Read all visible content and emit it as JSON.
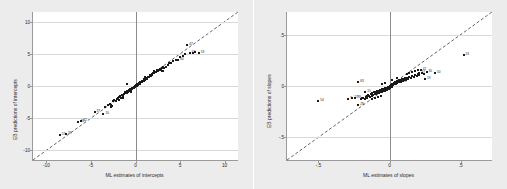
{
  "chart_data": [
    {
      "type": "scatter",
      "panel": "left",
      "title": "",
      "xlabel": "ML estimates of intercepts",
      "ylabel": "EB predictions of intercepts",
      "xlim": [
        -11.5,
        11.5
      ],
      "ylim": [
        -11.5,
        11.5
      ],
      "xticks": [
        -10,
        -5,
        0,
        5,
        10
      ],
      "xticklabels": [
        "-10",
        "-5",
        "0",
        "5",
        "10"
      ],
      "yticks": [
        -10,
        -5,
        0,
        5,
        10
      ],
      "yticklabels": [
        "-10",
        "-5",
        "0",
        "5",
        "10"
      ],
      "grid": "horizontal",
      "reference_line": {
        "type": "identity",
        "style": "dashed",
        "label": "y = x"
      },
      "points": [
        {
          "x": -8.5,
          "y": -7.6,
          "label": "57"
        },
        {
          "x": -7.8,
          "y": -7.5,
          "label": "39"
        },
        {
          "x": -6.4,
          "y": -5.6,
          "label": "40"
        },
        {
          "x": -6.1,
          "y": -5.5,
          "label": "62"
        },
        {
          "x": -4.6,
          "y": -4.0,
          "label": "37"
        },
        {
          "x": -3.6,
          "y": -4.3,
          "label": "10"
        },
        {
          "x": 4.8,
          "y": 4.1,
          "label": "60"
        },
        {
          "x": 5.8,
          "y": 6.3,
          "label": "47"
        },
        {
          "x": 6.1,
          "y": 5.2,
          "label": "61"
        },
        {
          "x": 7.1,
          "y": 5.1,
          "label": "53"
        },
        {
          "x": -3.4,
          "y": -3.2,
          "label": ""
        },
        {
          "x": -3.1,
          "y": -3.0,
          "label": ""
        },
        {
          "x": -2.9,
          "y": -2.8,
          "label": ""
        },
        {
          "x": -2.7,
          "y": -2.9,
          "label": ""
        },
        {
          "x": -2.5,
          "y": -2.4,
          "label": ""
        },
        {
          "x": -2.4,
          "y": -2.2,
          "label": ""
        },
        {
          "x": -2.2,
          "y": -2.3,
          "label": ""
        },
        {
          "x": -2.1,
          "y": -2.0,
          "label": ""
        },
        {
          "x": -2.0,
          "y": -1.9,
          "label": ""
        },
        {
          "x": -1.9,
          "y": -2.1,
          "label": ""
        },
        {
          "x": -1.8,
          "y": -1.7,
          "label": ""
        },
        {
          "x": -1.7,
          "y": -1.6,
          "label": ""
        },
        {
          "x": -1.6,
          "y": -1.8,
          "label": ""
        },
        {
          "x": -1.5,
          "y": -1.4,
          "label": ""
        },
        {
          "x": -1.4,
          "y": -1.5,
          "label": ""
        },
        {
          "x": -1.3,
          "y": -1.2,
          "label": ""
        },
        {
          "x": -1.25,
          "y": -1.3,
          "label": ""
        },
        {
          "x": -1.2,
          "y": -1.0,
          "label": ""
        },
        {
          "x": -1.1,
          "y": -1.1,
          "label": ""
        },
        {
          "x": -1.0,
          "y": -0.9,
          "label": ""
        },
        {
          "x": -0.95,
          "y": -1.05,
          "label": ""
        },
        {
          "x": -0.9,
          "y": -0.8,
          "label": ""
        },
        {
          "x": -0.85,
          "y": -0.95,
          "label": ""
        },
        {
          "x": -0.8,
          "y": -0.7,
          "label": ""
        },
        {
          "x": -0.75,
          "y": -0.85,
          "label": ""
        },
        {
          "x": -0.7,
          "y": -0.6,
          "label": ""
        },
        {
          "x": -0.65,
          "y": -0.75,
          "label": ""
        },
        {
          "x": -0.6,
          "y": -0.5,
          "label": ""
        },
        {
          "x": -0.55,
          "y": -0.65,
          "label": ""
        },
        {
          "x": -0.5,
          "y": -0.45,
          "label": ""
        },
        {
          "x": -0.45,
          "y": -0.55,
          "label": ""
        },
        {
          "x": -0.4,
          "y": -0.35,
          "label": ""
        },
        {
          "x": -0.35,
          "y": -0.45,
          "label": ""
        },
        {
          "x": -0.3,
          "y": -0.25,
          "label": ""
        },
        {
          "x": -0.25,
          "y": -0.35,
          "label": ""
        },
        {
          "x": -0.2,
          "y": -0.15,
          "label": ""
        },
        {
          "x": -0.15,
          "y": -0.25,
          "label": ""
        },
        {
          "x": -0.1,
          "y": -0.05,
          "label": ""
        },
        {
          "x": -0.05,
          "y": -0.15,
          "label": ""
        },
        {
          "x": -0.9,
          "y": 0.3,
          "label": ""
        },
        {
          "x": 0.0,
          "y": 0.05,
          "label": ""
        },
        {
          "x": 0.05,
          "y": -0.05,
          "label": ""
        },
        {
          "x": 0.1,
          "y": 0.15,
          "label": ""
        },
        {
          "x": 0.15,
          "y": 0.05,
          "label": ""
        },
        {
          "x": 0.2,
          "y": 0.25,
          "label": ""
        },
        {
          "x": 0.25,
          "y": 0.15,
          "label": ""
        },
        {
          "x": 0.3,
          "y": 0.35,
          "label": ""
        },
        {
          "x": 0.35,
          "y": 0.25,
          "label": ""
        },
        {
          "x": 0.4,
          "y": 0.45,
          "label": ""
        },
        {
          "x": 0.45,
          "y": 0.35,
          "label": ""
        },
        {
          "x": 0.5,
          "y": 0.55,
          "label": ""
        },
        {
          "x": 0.55,
          "y": 0.45,
          "label": ""
        },
        {
          "x": 0.6,
          "y": 0.65,
          "label": ""
        },
        {
          "x": 0.65,
          "y": 0.55,
          "label": ""
        },
        {
          "x": 0.7,
          "y": 0.75,
          "label": ""
        },
        {
          "x": 0.75,
          "y": 0.65,
          "label": ""
        },
        {
          "x": 0.8,
          "y": 0.85,
          "label": ""
        },
        {
          "x": 0.85,
          "y": 0.75,
          "label": ""
        },
        {
          "x": 0.9,
          "y": 0.95,
          "label": ""
        },
        {
          "x": 0.95,
          "y": 0.85,
          "label": ""
        },
        {
          "x": 1.0,
          "y": 1.05,
          "label": ""
        },
        {
          "x": 1.1,
          "y": 0.95,
          "label": ""
        },
        {
          "x": 1.2,
          "y": 1.25,
          "label": ""
        },
        {
          "x": 1.3,
          "y": 1.15,
          "label": ""
        },
        {
          "x": 1.4,
          "y": 1.45,
          "label": ""
        },
        {
          "x": 1.5,
          "y": 1.35,
          "label": ""
        },
        {
          "x": 1.6,
          "y": 1.65,
          "label": ""
        },
        {
          "x": 1.7,
          "y": 1.55,
          "label": ""
        },
        {
          "x": 1.8,
          "y": 1.85,
          "label": ""
        },
        {
          "x": 1.9,
          "y": 1.75,
          "label": ""
        },
        {
          "x": 2.0,
          "y": 2.05,
          "label": ""
        },
        {
          "x": 2.1,
          "y": 1.95,
          "label": ""
        },
        {
          "x": 2.2,
          "y": 2.25,
          "label": ""
        },
        {
          "x": 2.3,
          "y": 2.15,
          "label": ""
        },
        {
          "x": 2.4,
          "y": 2.45,
          "label": ""
        },
        {
          "x": 2.5,
          "y": 2.35,
          "label": ""
        },
        {
          "x": 2.6,
          "y": 2.55,
          "label": ""
        },
        {
          "x": 2.7,
          "y": 2.45,
          "label": ""
        },
        {
          "x": 2.8,
          "y": 2.65,
          "label": ""
        },
        {
          "x": 2.9,
          "y": 2.55,
          "label": ""
        },
        {
          "x": 3.0,
          "y": 2.75,
          "label": ""
        },
        {
          "x": 3.1,
          "y": 2.9,
          "label": ""
        },
        {
          "x": 3.2,
          "y": 2.8,
          "label": ""
        },
        {
          "x": 3.4,
          "y": 3.0,
          "label": ""
        },
        {
          "x": 3.6,
          "y": 3.3,
          "label": ""
        },
        {
          "x": 3.8,
          "y": 3.5,
          "label": ""
        },
        {
          "x": 4.0,
          "y": 3.6,
          "label": ""
        },
        {
          "x": 4.2,
          "y": 3.9,
          "label": ""
        },
        {
          "x": 4.5,
          "y": 4.0,
          "label": ""
        },
        {
          "x": 5.0,
          "y": 4.5,
          "label": ""
        },
        {
          "x": 5.3,
          "y": 4.7,
          "label": ""
        },
        {
          "x": 5.6,
          "y": 5.0,
          "label": ""
        },
        {
          "x": 6.4,
          "y": 5.2,
          "label": ""
        },
        {
          "x": 6.7,
          "y": 5.25,
          "label": ""
        },
        {
          "x": -2.8,
          "y": -3.3,
          "label": ""
        },
        {
          "x": -2.6,
          "y": -3.1,
          "label": ""
        },
        {
          "x": -1.45,
          "y": -1.9,
          "label": ""
        },
        {
          "x": -0.55,
          "y": -1.0,
          "label": ""
        },
        {
          "x": 1.05,
          "y": 1.4,
          "label": ""
        },
        {
          "x": 2.05,
          "y": 2.4,
          "label": ""
        },
        {
          "x": 2.95,
          "y": 2.35,
          "label": ""
        },
        {
          "x": 3.05,
          "y": 2.3,
          "label": ""
        }
      ]
    },
    {
      "type": "scatter",
      "panel": "right",
      "title": "",
      "xlabel": "ML estimates of slopes",
      "ylabel": "EB predictions of slopes",
      "xlim": [
        -0.72,
        0.72
      ],
      "ylim": [
        -0.72,
        0.72
      ],
      "xticks": [
        -0.5,
        0,
        0.5
      ],
      "xticklabels": [
        "-.5",
        "0",
        ".5"
      ],
      "yticks": [
        -0.5,
        0,
        0.5
      ],
      "yticklabels": [
        "-.5",
        "0",
        ".5"
      ],
      "grid": "horizontal",
      "reference_line": {
        "type": "identity",
        "style": "dashed",
        "label": "y = x"
      },
      "points": [
        {
          "x": 0.52,
          "y": 0.3,
          "label": "53"
        },
        {
          "x": -0.5,
          "y": -0.15,
          "label": "54"
        },
        {
          "x": -0.22,
          "y": 0.04,
          "label": "63"
        },
        {
          "x": -0.26,
          "y": -0.12,
          "label": "57"
        },
        {
          "x": -0.24,
          "y": -0.12,
          "label": "39"
        },
        {
          "x": -0.19,
          "y": -0.12,
          "label": "1"
        },
        {
          "x": -0.22,
          "y": -0.18,
          "label": "28"
        },
        {
          "x": -0.29,
          "y": -0.13,
          "label": "9"
        },
        {
          "x": -0.17,
          "y": -0.06,
          "label": "15"
        },
        {
          "x": 0.08,
          "y": 0.04,
          "label": "13"
        },
        {
          "x": 0.21,
          "y": 0.13,
          "label": "47"
        },
        {
          "x": 0.22,
          "y": 0.16,
          "label": "42"
        },
        {
          "x": 0.26,
          "y": 0.14,
          "label": "30"
        },
        {
          "x": 0.32,
          "y": 0.13,
          "label": "50"
        },
        {
          "x": 0.25,
          "y": 0.07,
          "label": "19"
        },
        {
          "x": -0.16,
          "y": -0.1,
          "label": ""
        },
        {
          "x": -0.15,
          "y": -0.09,
          "label": ""
        },
        {
          "x": -0.14,
          "y": -0.11,
          "label": ""
        },
        {
          "x": -0.13,
          "y": -0.08,
          "label": ""
        },
        {
          "x": -0.125,
          "y": -0.1,
          "label": ""
        },
        {
          "x": -0.12,
          "y": -0.07,
          "label": ""
        },
        {
          "x": -0.115,
          "y": -0.09,
          "label": ""
        },
        {
          "x": -0.11,
          "y": -0.06,
          "label": ""
        },
        {
          "x": -0.105,
          "y": -0.08,
          "label": ""
        },
        {
          "x": -0.1,
          "y": -0.055,
          "label": ""
        },
        {
          "x": -0.095,
          "y": -0.075,
          "label": ""
        },
        {
          "x": -0.09,
          "y": -0.05,
          "label": ""
        },
        {
          "x": -0.085,
          "y": -0.07,
          "label": ""
        },
        {
          "x": -0.08,
          "y": -0.045,
          "label": ""
        },
        {
          "x": -0.075,
          "y": -0.065,
          "label": ""
        },
        {
          "x": -0.07,
          "y": -0.04,
          "label": ""
        },
        {
          "x": -0.065,
          "y": -0.06,
          "label": ""
        },
        {
          "x": -0.06,
          "y": -0.035,
          "label": ""
        },
        {
          "x": -0.055,
          "y": -0.055,
          "label": ""
        },
        {
          "x": -0.05,
          "y": -0.03,
          "label": ""
        },
        {
          "x": -0.045,
          "y": -0.05,
          "label": ""
        },
        {
          "x": -0.04,
          "y": -0.025,
          "label": ""
        },
        {
          "x": -0.035,
          "y": -0.045,
          "label": ""
        },
        {
          "x": -0.03,
          "y": -0.02,
          "label": ""
        },
        {
          "x": -0.025,
          "y": -0.04,
          "label": ""
        },
        {
          "x": -0.02,
          "y": -0.015,
          "label": ""
        },
        {
          "x": -0.015,
          "y": -0.035,
          "label": ""
        },
        {
          "x": -0.01,
          "y": -0.01,
          "label": ""
        },
        {
          "x": -0.005,
          "y": -0.03,
          "label": ""
        },
        {
          "x": 0.0,
          "y": 0.0,
          "label": ""
        },
        {
          "x": 0.005,
          "y": -0.02,
          "label": ""
        },
        {
          "x": 0.01,
          "y": 0.01,
          "label": ""
        },
        {
          "x": 0.015,
          "y": -0.01,
          "label": ""
        },
        {
          "x": 0.02,
          "y": 0.02,
          "label": ""
        },
        {
          "x": 0.025,
          "y": 0.005,
          "label": ""
        },
        {
          "x": 0.03,
          "y": 0.03,
          "label": ""
        },
        {
          "x": 0.035,
          "y": 0.015,
          "label": ""
        },
        {
          "x": 0.04,
          "y": 0.035,
          "label": ""
        },
        {
          "x": 0.045,
          "y": 0.02,
          "label": ""
        },
        {
          "x": 0.05,
          "y": 0.045,
          "label": ""
        },
        {
          "x": 0.055,
          "y": 0.03,
          "label": ""
        },
        {
          "x": 0.06,
          "y": 0.05,
          "label": ""
        },
        {
          "x": 0.065,
          "y": 0.035,
          "label": ""
        },
        {
          "x": 0.07,
          "y": 0.055,
          "label": ""
        },
        {
          "x": 0.075,
          "y": 0.04,
          "label": ""
        },
        {
          "x": 0.08,
          "y": 0.06,
          "label": ""
        },
        {
          "x": 0.085,
          "y": 0.045,
          "label": ""
        },
        {
          "x": 0.09,
          "y": 0.065,
          "label": ""
        },
        {
          "x": 0.095,
          "y": 0.05,
          "label": ""
        },
        {
          "x": 0.1,
          "y": 0.07,
          "label": ""
        },
        {
          "x": 0.105,
          "y": 0.055,
          "label": ""
        },
        {
          "x": 0.11,
          "y": 0.075,
          "label": ""
        },
        {
          "x": 0.115,
          "y": 0.06,
          "label": ""
        },
        {
          "x": 0.12,
          "y": 0.08,
          "label": ""
        },
        {
          "x": 0.13,
          "y": 0.07,
          "label": ""
        },
        {
          "x": 0.14,
          "y": 0.09,
          "label": ""
        },
        {
          "x": 0.15,
          "y": 0.08,
          "label": ""
        },
        {
          "x": 0.16,
          "y": 0.1,
          "label": ""
        },
        {
          "x": 0.17,
          "y": 0.09,
          "label": ""
        },
        {
          "x": 0.18,
          "y": 0.11,
          "label": ""
        },
        {
          "x": 0.19,
          "y": 0.1,
          "label": ""
        },
        {
          "x": 0.2,
          "y": 0.12,
          "label": ""
        },
        {
          "x": 0.205,
          "y": 0.105,
          "label": ""
        },
        {
          "x": 0.23,
          "y": 0.125,
          "label": ""
        },
        {
          "x": 0.24,
          "y": 0.115,
          "label": ""
        },
        {
          "x": -0.2,
          "y": -0.13,
          "label": ""
        },
        {
          "x": -0.185,
          "y": -0.115,
          "label": ""
        },
        {
          "x": -0.175,
          "y": -0.125,
          "label": ""
        },
        {
          "x": -0.165,
          "y": -0.105,
          "label": ""
        },
        {
          "x": -0.155,
          "y": -0.115,
          "label": ""
        },
        {
          "x": -0.145,
          "y": -0.095,
          "label": ""
        },
        {
          "x": -0.135,
          "y": -0.105,
          "label": ""
        },
        {
          "x": -0.05,
          "y": 0.02,
          "label": ""
        },
        {
          "x": -0.03,
          "y": 0.03,
          "label": ""
        },
        {
          "x": 0.02,
          "y": 0.06,
          "label": ""
        },
        {
          "x": 0.05,
          "y": 0.08,
          "label": ""
        },
        {
          "x": 0.12,
          "y": 0.115,
          "label": ""
        },
        {
          "x": 0.14,
          "y": 0.125,
          "label": ""
        },
        {
          "x": 0.16,
          "y": 0.135,
          "label": ""
        },
        {
          "x": 0.18,
          "y": 0.145,
          "label": ""
        },
        {
          "x": 0.2,
          "y": 0.155,
          "label": ""
        },
        {
          "x": -0.12,
          "y": -0.13,
          "label": ""
        },
        {
          "x": -0.1,
          "y": -0.12,
          "label": ""
        },
        {
          "x": -0.08,
          "y": -0.11,
          "label": ""
        },
        {
          "x": -0.06,
          "y": -0.1,
          "label": ""
        }
      ]
    }
  ]
}
